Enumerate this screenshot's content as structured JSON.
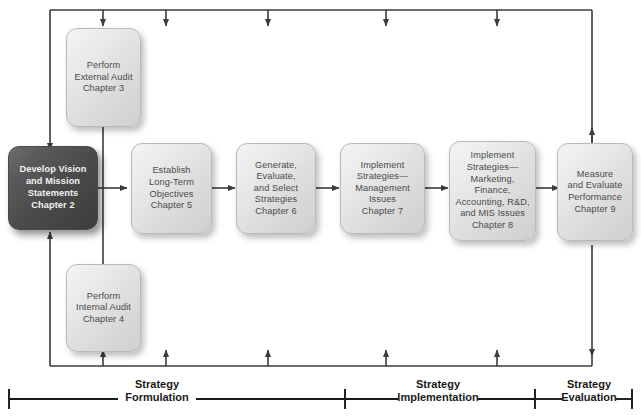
{
  "diagram": {
    "accent_dark": "#4a4a4a",
    "box_fill": "#e6e6e6",
    "line_color": "#3c3c3c",
    "nodes": [
      {
        "id": "external-audit",
        "label": "Perform\nExternal Audit\nChapter 3",
        "chapter": "Chapter 3",
        "highlight": false
      },
      {
        "id": "vision-mission",
        "label": "Develop Vision\nand Mission\nStatements\nChapter 2",
        "chapter": "Chapter 2",
        "highlight": true
      },
      {
        "id": "internal-audit",
        "label": "Perform\nInternal Audit\nChapter 4",
        "chapter": "Chapter 4",
        "highlight": false
      },
      {
        "id": "long-term-objectives",
        "label": "Establish\nLong-Term\nObjectives\nChapter 5",
        "chapter": "Chapter 5",
        "highlight": false
      },
      {
        "id": "select-strategies",
        "label": "Generate,\nEvaluate,\nand Select\nStrategies\nChapter 6",
        "chapter": "Chapter 6",
        "highlight": false
      },
      {
        "id": "implement-management",
        "label": "Implement\nStrategies—\nManagement\nIssues\nChapter 7",
        "chapter": "Chapter 7",
        "highlight": false
      },
      {
        "id": "implement-functional",
        "label": "Implement\nStrategies—\nMarketing,\nFinance,\nAccounting, R&D,\nand MIS Issues\nChapter 8",
        "chapter": "Chapter 8",
        "highlight": false
      },
      {
        "id": "measure-evaluate",
        "label": "Measure\nand Evaluate\nPerformance\nChapter 9",
        "chapter": "Chapter 9",
        "highlight": false
      }
    ],
    "phases": [
      {
        "id": "strategy-formulation",
        "label": "Strategy\nFormulation"
      },
      {
        "id": "strategy-implementation",
        "label": "Strategy\nImplementation"
      },
      {
        "id": "strategy-evaluation",
        "label": "Strategy\nEvaluation"
      }
    ]
  }
}
